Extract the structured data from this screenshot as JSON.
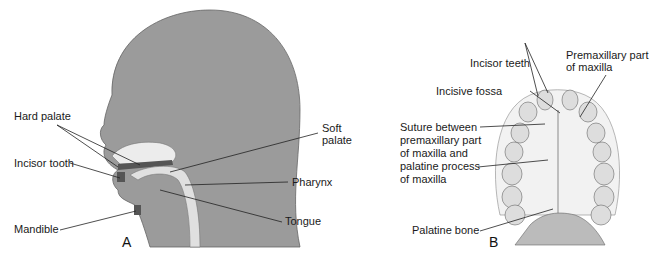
{
  "figure": {
    "panels": [
      {
        "id": "A",
        "letter": "A",
        "description": "Sagittal view of head showing oral and pharyngeal structures",
        "labels": {
          "hard_palate": "Hard palate",
          "incisor_tooth": "Incisor tooth",
          "mandible": "Mandible",
          "soft_palate_line1": "Soft",
          "soft_palate_line2": "palate",
          "pharynx": "Pharynx",
          "tongue": "Tongue"
        }
      },
      {
        "id": "B",
        "letter": "B",
        "description": "Inferior view of palate and maxillary dental arch",
        "labels": {
          "incisor_teeth": "Incisor teeth",
          "premaxillary_line1": "Premaxillary part",
          "premaxillary_line2": "of maxilla",
          "incisive_fossa": "Incisive fossa",
          "suture_line1": "Suture between",
          "suture_line2": "premaxillary part",
          "suture_line3": "of maxilla and",
          "suture_line4": "palatine process",
          "suture_line5": "of maxilla",
          "palatine_bone": "Palatine bone"
        }
      }
    ],
    "colors": {
      "head_gray": "#9a9a9a",
      "light_tissue": "#e2e2e2",
      "dark_tissue": "#5a5a5a",
      "outline": "#555555",
      "leader_line": "#222222"
    }
  }
}
